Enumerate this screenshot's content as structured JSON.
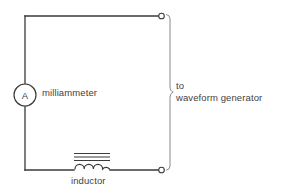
{
  "diagram": {
    "background_color": "#ffffff",
    "line_color": "#3a3a3a",
    "text_color": "#3f3f3f",
    "bracket_color": "#8a8a8a"
  },
  "components": {
    "milliammeter": {
      "symbol_letter": "A",
      "label": "milliammeter",
      "shape": "circle",
      "center_x": 30,
      "center_y": 95,
      "radius": 11
    },
    "inductor": {
      "label": "inductor",
      "symbol": "coil-with-core",
      "coil_bumps": 4,
      "core_lines": 3,
      "center_x": 92,
      "center_y": 166
    },
    "terminal_top": {
      "name": "top-right terminal",
      "x": 162,
      "y": 16,
      "radius": 3
    },
    "terminal_bottom": {
      "name": "bottom-right terminal",
      "x": 162,
      "y": 170,
      "radius": 3
    }
  },
  "annotations": {
    "generator": {
      "line1": "to",
      "line2": "waveform generator"
    }
  },
  "wires": {
    "left_x": 25,
    "right_x": 162,
    "top_y": 16,
    "bottom_y": 170
  }
}
